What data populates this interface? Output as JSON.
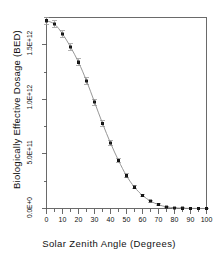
{
  "chart_data": {
    "type": "scatter",
    "title": "",
    "xlabel": "Solar Zenith Angle (Degrees)",
    "ylabel": "Biologically Effective Dosage (BED)",
    "xlim": [
      0,
      100
    ],
    "ylim": [
      0,
      1750000000000
    ],
    "grid": false,
    "legend": null,
    "marker": "square",
    "marker_color": "#202020",
    "line_color": "#8a8a8a",
    "errorbars": true,
    "x_major_step": 10,
    "x_minor_step": 5,
    "x_tick_labels": [
      "0",
      "10",
      "20",
      "30",
      "40",
      "50",
      "60",
      "70",
      "80",
      "90",
      "100"
    ],
    "x_tick_values": [
      0,
      10,
      20,
      30,
      40,
      50,
      60,
      70,
      80,
      90,
      100
    ],
    "y_tick_labels": [
      "0.0E+0",
      "5.0E+11",
      "1.0E+12",
      "1.5E+12"
    ],
    "y_tick_values": [
      0,
      500000000000,
      1000000000000,
      1500000000000
    ],
    "x": [
      0,
      5,
      10,
      15,
      20,
      25,
      30,
      35,
      40,
      45,
      50,
      55,
      60,
      65,
      70,
      75,
      80,
      85,
      90,
      95,
      100
    ],
    "values": [
      1720000000000,
      1690000000000,
      1600000000000,
      1480000000000,
      1340000000000,
      1170000000000,
      975000000000,
      780000000000,
      600000000000,
      440000000000,
      300000000000,
      195000000000,
      120000000000,
      68000000000,
      35000000000,
      15000000000,
      6000000000,
      2000000000,
      1000000000,
      500000000,
      200000000
    ],
    "yerr": [
      30000000000,
      30000000000,
      30000000000,
      30000000000,
      30000000000,
      30000000000,
      28000000000,
      26000000000,
      24000000000,
      22000000000,
      18000000000,
      15000000000,
      12000000000,
      9000000000,
      7000000000,
      5000000000,
      4000000000,
      3000000000,
      3000000000,
      3000000000,
      3000000000
    ]
  }
}
